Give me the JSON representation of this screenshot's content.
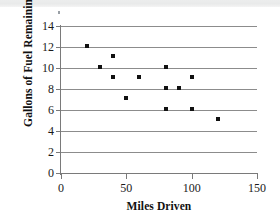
{
  "chart_data": {
    "type": "scatter",
    "title": "",
    "xlabel": "Miles Driven",
    "ylabel": "Gallons of Fuel Remaining",
    "xlim": [
      0,
      150
    ],
    "ylim": [
      0,
      14
    ],
    "xticks": [
      0,
      50,
      100,
      150
    ],
    "yticks": [
      0,
      2,
      4,
      6,
      8,
      10,
      12,
      14
    ],
    "xtick_labels": [
      "0",
      "50",
      "100",
      "150"
    ],
    "ytick_labels": [
      "0",
      "2",
      "4",
      "6",
      "8",
      "10",
      "12",
      "14"
    ],
    "grid": "horizontal",
    "legend": "none",
    "marker": "square",
    "marker_color": "#111111",
    "gridline_color": "#8c8c8c",
    "background_color": "#ffffff",
    "series": [
      {
        "name": "Fuel vs Miles",
        "points": [
          {
            "x": 20,
            "y": 12.1
          },
          {
            "x": 30,
            "y": 10.1
          },
          {
            "x": 40,
            "y": 11.1
          },
          {
            "x": 40,
            "y": 9.1
          },
          {
            "x": 50,
            "y": 7.1
          },
          {
            "x": 60,
            "y": 9.1
          },
          {
            "x": 80,
            "y": 10.1
          },
          {
            "x": 80,
            "y": 8.1
          },
          {
            "x": 80,
            "y": 6.1
          },
          {
            "x": 90,
            "y": 8.1
          },
          {
            "x": 100,
            "y": 9.1
          },
          {
            "x": 100,
            "y": 6.1
          },
          {
            "x": 120,
            "y": 5.1
          }
        ]
      }
    ]
  }
}
